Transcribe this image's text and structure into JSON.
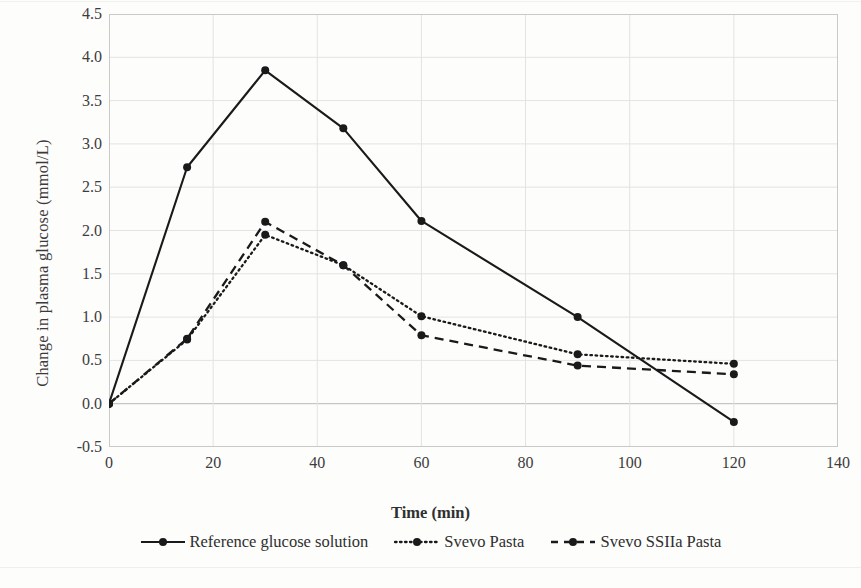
{
  "chart_data": {
    "type": "line",
    "title": "",
    "xlabel": "Time (min)",
    "ylabel": "Change in plasma glucose (mmol/L)",
    "xlim": [
      0,
      140
    ],
    "ylim": [
      -0.5,
      4.5
    ],
    "xticks": [
      0,
      20,
      40,
      60,
      80,
      100,
      120,
      140
    ],
    "yticks": [
      -0.5,
      0.0,
      0.5,
      1.0,
      1.5,
      2.0,
      2.5,
      3.0,
      3.5,
      4.0,
      4.5
    ],
    "xtick_labels": [
      "0",
      "20",
      "40",
      "60",
      "80",
      "100",
      "120",
      "140"
    ],
    "ytick_labels": [
      "-0.5",
      "0.0",
      "0.5",
      "1.0",
      "1.5",
      "2.0",
      "2.5",
      "3.0",
      "3.5",
      "4.0",
      "4.5"
    ],
    "grid": true,
    "legend_position": "bottom",
    "x": [
      0,
      15,
      30,
      45,
      60,
      90,
      120
    ],
    "series": [
      {
        "name": "Reference glucose solution",
        "style": "solid",
        "color": "#1a1a1a",
        "marker": "circle",
        "values": [
          0.0,
          2.73,
          3.85,
          3.18,
          2.11,
          1.0,
          -0.21
        ]
      },
      {
        "name": "Svevo Pasta",
        "style": "dotted",
        "color": "#1a1a1a",
        "marker": "circle",
        "values": [
          0.0,
          0.74,
          1.95,
          1.6,
          1.01,
          0.57,
          0.46
        ]
      },
      {
        "name": "Svevo SSIIa Pasta",
        "style": "dashed",
        "color": "#1a1a1a",
        "marker": "circle",
        "values": [
          0.0,
          0.75,
          2.1,
          1.6,
          0.79,
          0.44,
          0.34
        ]
      }
    ]
  },
  "axis": {
    "y_title": "Change in plasma glucose (mmol/L)",
    "x_title": "Time (min)"
  },
  "legend": {
    "items": [
      {
        "label": "Reference glucose solution",
        "style": "solid"
      },
      {
        "label": "Svevo Pasta",
        "style": "dotted"
      },
      {
        "label": "Svevo SSIIa Pasta",
        "style": "dashed"
      }
    ]
  },
  "colors": {
    "ink": "#1a1a1a",
    "grid": "#e3e3e1",
    "axis": "#c9c9c7",
    "text": "#2f2f2f",
    "paper": "#fdfdfc"
  }
}
